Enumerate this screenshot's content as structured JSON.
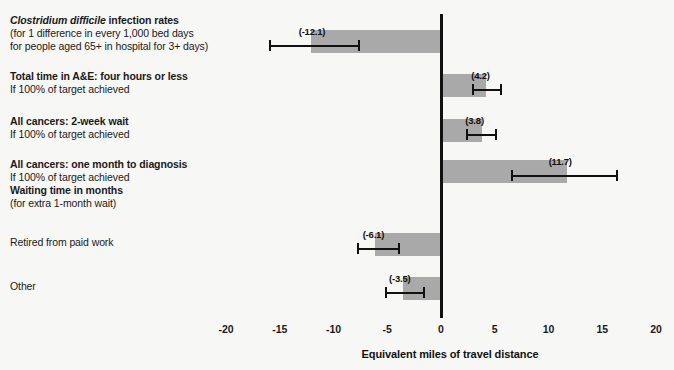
{
  "chart_data": {
    "type": "bar",
    "orientation": "horizontal",
    "title": "",
    "xlabel": "Equivalent miles of travel distance",
    "ylabel": "",
    "xlim": [
      -22,
      22
    ],
    "xticks": [
      -20,
      -15,
      -10,
      -5,
      0,
      5,
      10,
      15,
      20
    ],
    "xtick_labels": [
      "-20",
      "-15",
      "-10",
      "-5",
      "0",
      "5",
      "10",
      "15",
      "20"
    ],
    "grid": false,
    "legend": "none",
    "zero_reference_line": 0,
    "bar_color": "#a9a9a9",
    "axis_color": "#111111",
    "categories": [
      "Clostridium difficile infection rates",
      "Total time in A&E: four hours or less",
      "All cancers: 2-week wait",
      "All cancers: one month to diagnosis",
      "Retired from paid work",
      "Other"
    ],
    "values": [
      -12.1,
      4.2,
      3.8,
      11.7,
      -6.1,
      -3.5
    ],
    "value_labels": [
      "(-12.1)",
      "(4.2)",
      "(3.8)",
      "(11.7)",
      "(-6.1)",
      "(-3.5)"
    ],
    "error_bars": [
      {
        "low": -16.0,
        "high": -7.5
      },
      {
        "low": 2.9,
        "high": 5.7
      },
      {
        "low": 2.3,
        "high": 5.2
      },
      {
        "low": 6.5,
        "high": 16.5
      },
      {
        "low": -7.8,
        "high": -3.8
      },
      {
        "low": -5.2,
        "high": -1.5
      }
    ]
  },
  "rows": [
    {
      "title_prefix_italic": "Clostridium difficile",
      "title_rest": " infection rates",
      "sub1": "(for 1 difference in every 1,000 bed days",
      "sub2": "for people aged 65+ in hospital for 3+ days)",
      "value_label": "(-12.1)"
    },
    {
      "title": "Total time in A&E: four hours or less",
      "sub1": "If 100% of target achieved",
      "value_label": "(4.2)"
    },
    {
      "title": "All cancers: 2-week wait",
      "sub1": "If 100% of target achieved",
      "value_label": "(3.8)"
    },
    {
      "title": "All cancers: one month to diagnosis",
      "sub1": "If 100% of target achieved",
      "title2": "Waiting time in months",
      "sub2": "(for extra 1-month wait)",
      "value_label": "(11.7)"
    },
    {
      "title": "Retired from paid work",
      "value_label": "(-6.1)"
    },
    {
      "title": "Other",
      "value_label": "(-3.5)"
    }
  ],
  "axis": {
    "title": "Equivalent miles of travel distance",
    "tick_labels": [
      "-20",
      "-15",
      "-10",
      "-5",
      "0",
      "5",
      "10",
      "15",
      "20"
    ]
  }
}
